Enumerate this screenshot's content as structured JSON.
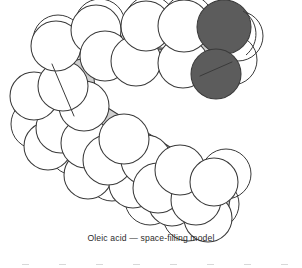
{
  "figure": {
    "name": "space-filling-model",
    "molecule": "Oleic acid",
    "model_type": "space-filling model",
    "caption": "Oleic acid — space-filling model",
    "background_color": "#ffffff"
  },
  "colors": {
    "hydrogen_sphere_fill": "#ffffff",
    "carbon_wedge_fill": "#d0d0d0",
    "oxygen_sphere_fill": "#5c5c5c",
    "outline": "#3a3a3a",
    "caption_text": "#2b2b2b",
    "footer_tick": "#d8d8d8"
  },
  "atoms": {
    "hydrogen_label": "H",
    "carbon_label": "C",
    "oxygen_label": "O",
    "oxygen_count": 2,
    "hydrogen_sphere_radius": 25,
    "oxygen_sphere_radius": 27
  },
  "geometry": {
    "upper_chain_note": "ascending chain from kink to carboxyl group, upper right",
    "lower_chain_note": "descending chain from kink to terminal methyl, lower right",
    "kink_note": "cis double bond kink at left of model",
    "hydrogen_spheres": [
      {
        "cx": 63,
        "cy": 86,
        "r": 25
      },
      {
        "cx": 44,
        "cy": 70,
        "r": 25
      },
      {
        "cx": 34,
        "cy": 96,
        "r": 24
      },
      {
        "cx": 56,
        "cy": 46,
        "r": 25
      },
      {
        "cx": 105,
        "cy": 56,
        "r": 25
      },
      {
        "cx": 96,
        "cy": 30,
        "r": 25
      },
      {
        "cx": 121,
        "cy": 33,
        "r": 25
      },
      {
        "cx": 136,
        "cy": 61,
        "r": 25
      },
      {
        "cx": 160,
        "cy": 38,
        "r": 25
      },
      {
        "cx": 146,
        "cy": 26,
        "r": 25
      },
      {
        "cx": 183,
        "cy": 63,
        "r": 25
      },
      {
        "cx": 176,
        "cy": 30,
        "r": 26
      },
      {
        "cx": 198,
        "cy": 26,
        "r": 25
      },
      {
        "cx": 84,
        "cy": 106,
        "r": 25
      },
      {
        "cx": 61,
        "cy": 128,
        "r": 25
      },
      {
        "cx": 48,
        "cy": 146,
        "r": 24
      },
      {
        "cx": 86,
        "cy": 143,
        "r": 25
      },
      {
        "cx": 108,
        "cy": 160,
        "r": 25
      },
      {
        "cx": 88,
        "cy": 175,
        "r": 24
      },
      {
        "cx": 124,
        "cy": 139,
        "r": 25
      },
      {
        "cx": 146,
        "cy": 160,
        "r": 25
      },
      {
        "cx": 133,
        "cy": 184,
        "r": 24
      },
      {
        "cx": 158,
        "cy": 188,
        "r": 25
      },
      {
        "cx": 180,
        "cy": 170,
        "r": 25
      },
      {
        "cx": 172,
        "cy": 202,
        "r": 24
      },
      {
        "cx": 196,
        "cy": 200,
        "r": 25
      },
      {
        "cx": 214,
        "cy": 182,
        "r": 24
      }
    ],
    "oxygen_spheres": [
      {
        "cx": 224,
        "cy": 27,
        "r": 27
      },
      {
        "cx": 216,
        "cy": 74,
        "r": 25
      }
    ]
  },
  "footer": {
    "tick_count": 8,
    "note": "faint clipped marks at bottom edge"
  }
}
